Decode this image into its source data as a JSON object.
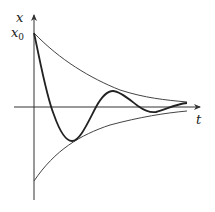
{
  "diagram": {
    "axes": {
      "x_label": "t",
      "y_label": "x",
      "y_tick_label": "x",
      "y_tick_subscript": "0"
    },
    "curves": [
      {
        "name": "upper-envelope",
        "description": "x0·e^{-at}"
      },
      {
        "name": "lower-envelope",
        "description": "-x0·e^{-at}"
      },
      {
        "name": "damped-oscillation",
        "description": "x0·e^{-at}·cos(ωt)"
      }
    ],
    "colors": {
      "axis": "#333333",
      "envelope": "#444444",
      "oscillation": "#222222"
    }
  }
}
